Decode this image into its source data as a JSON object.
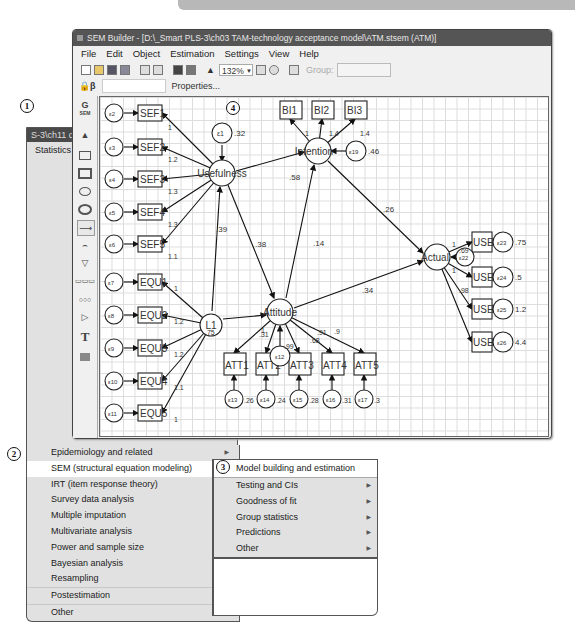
{
  "stata_window": {
    "title": "S-3\\ch11 q",
    "menu_top": "Statistics",
    "truncated_items": [
      "Summ",
      "Linea",
      "Binar",
      "Ordin",
      "Categ",
      "Coun",
      "Fracti",
      "Gene",
      "Treat",
      "Endo",
      "Samp",
      "Exact",
      "Nonp",
      "Time",
      "Multi",
      "Longi",
      "Multi",
      "Surviv"
    ]
  },
  "statistics_menu": {
    "items": [
      {
        "label": "Epidemiology and related",
        "has_submenu": true
      },
      {
        "label": "SEM (structural equation modeling)",
        "has_submenu": true,
        "highlighted": true
      },
      {
        "label": "IRT (item response theory)",
        "has_submenu": false
      },
      {
        "label": "Survey data analysis",
        "has_submenu": true
      },
      {
        "label": "Multiple imputation",
        "has_submenu": false
      },
      {
        "label": "Multivariate analysis",
        "has_submenu": true
      },
      {
        "label": "Power and sample size",
        "has_submenu": false
      },
      {
        "label": "Bayesian analysis",
        "has_submenu": true
      },
      {
        "label": "Resampling",
        "has_submenu": true
      },
      {
        "label": "Postestimation",
        "has_submenu": false
      },
      {
        "label": "Other",
        "has_submenu": true
      }
    ]
  },
  "sem_submenu": {
    "items": [
      {
        "label": "Model building and estimation",
        "has_submenu": false,
        "highlighted": true
      },
      {
        "label": "Testing and CIs",
        "has_submenu": true
      },
      {
        "label": "Goodness of fit",
        "has_submenu": true
      },
      {
        "label": "Group statistics",
        "has_submenu": true
      },
      {
        "label": "Predictions",
        "has_submenu": true
      },
      {
        "label": "Other",
        "has_submenu": true
      }
    ]
  },
  "callouts": [
    "1",
    "2",
    "3",
    "4"
  ],
  "sem_builder": {
    "title": "SEM Builder - [D:\\_Smart PLS-3\\ch03 TAM-technology acceptance model\\ATM.stsem (ATM)]",
    "menubar": [
      "File",
      "Edit",
      "Object",
      "Estimation",
      "Settings",
      "View",
      "Help"
    ],
    "zoom": "132%",
    "group_label": "Group:",
    "properties_label": "Properties...",
    "prop_prefix": "β",
    "palette_sem": "G",
    "palette_sem_sub": "SEM",
    "palette_text_tool": "T"
  },
  "diagram": {
    "latents": {
      "usefulness": "Usefulness",
      "intention": "Intention",
      "attitude": "Attitude",
      "actual": "Actual",
      "l1": "L1"
    },
    "errors": {
      "e1": {
        "label": "ε1",
        "var": ".32"
      },
      "e19": {
        "label": "ε19",
        "var": ".46"
      },
      "e12": {
        "label": "ε12"
      },
      "e22": {
        "label": "ε22",
        "var": ".69"
      },
      "e23": {
        "label": "ε23",
        "var": ".75"
      },
      "e24": {
        "label": "ε24",
        "var": ".5"
      },
      "e25": {
        "label": "ε25",
        "var": "1.2"
      },
      "e26": {
        "label": "ε26",
        "var": "4.4"
      },
      "e13": {
        "label": "ε13",
        "var": ".26"
      },
      "e14": {
        "label": "ε14",
        "var": ".24"
      },
      "e15": {
        "label": "ε15",
        "var": ".28"
      },
      "e16": {
        "label": "ε16",
        "var": ".31"
      },
      "e17": {
        "label": "ε17",
        "var": ".3"
      }
    },
    "indicators": {
      "sef": [
        {
          "label": "SEF1",
          "err": "ε2",
          "int": "6.6"
        },
        {
          "label": "SEF2",
          "err": "ε3",
          "int": "6.5"
        },
        {
          "label": "SEF3",
          "err": "ε4",
          "int": "6.6"
        },
        {
          "label": "SEF4",
          "err": "ε5",
          "int": "6.4"
        },
        {
          "label": "SEF5",
          "err": "ε6",
          "int": "6.5"
        }
      ],
      "equ": [
        {
          "label": "EQU1",
          "err": "ε7",
          "int": "6"
        },
        {
          "label": "EQU2",
          "err": "ε8",
          "int": "5.6"
        },
        {
          "label": "EQU3",
          "err": "ε9",
          "int": "5.9"
        },
        {
          "label": "EQU4",
          "err": "ε10",
          "int": "5.8"
        },
        {
          "label": "EQU5",
          "err": "ε11",
          "int": "5.9"
        }
      ],
      "bi": [
        {
          "label": "BI1",
          "int": "6.2"
        },
        {
          "label": "BI2",
          "int": "5.6"
        },
        {
          "label": "BI3",
          "int": "6"
        }
      ],
      "att": [
        {
          "label": "ATT1",
          "int": "6.2"
        },
        {
          "label": "ATT2",
          "int": "6.1"
        },
        {
          "label": "ATT3",
          "int": "6.1"
        },
        {
          "label": "ATT4",
          "int": "6.3"
        },
        {
          "label": "ATT5",
          "int": "6.3"
        }
      ],
      "use": [
        {
          "label": "USE1",
          "int": "5"
        },
        {
          "label": "USE2",
          "int": "5.5"
        },
        {
          "label": "USE3",
          "int": "5.3"
        },
        {
          "label": "USE4",
          "int": "5.8"
        }
      ]
    },
    "loadings": {
      "sef": [
        "1",
        "1.2",
        "1.3",
        "1.3",
        "1.1"
      ],
      "equ": [
        "1",
        "1.2",
        "1.2",
        "1.1",
        "1"
      ],
      "bi": [
        "1",
        "1.4",
        "1.4"
      ],
      "att": [
        ".31",
        "1",
        ".99",
        ".68",
        ".91",
        ".9"
      ],
      "use": [
        "1",
        "1",
        ".98"
      ]
    },
    "paths": {
      "usefulness_intention": ".58",
      "usefulness_attitude": ".38",
      "l1_usefulness": ".39",
      "attitude_intention": ".14",
      "intention_actual": ".26",
      "attitude_actual": ".34",
      "l1_var": ".75",
      "attitude_err": ".99"
    }
  }
}
